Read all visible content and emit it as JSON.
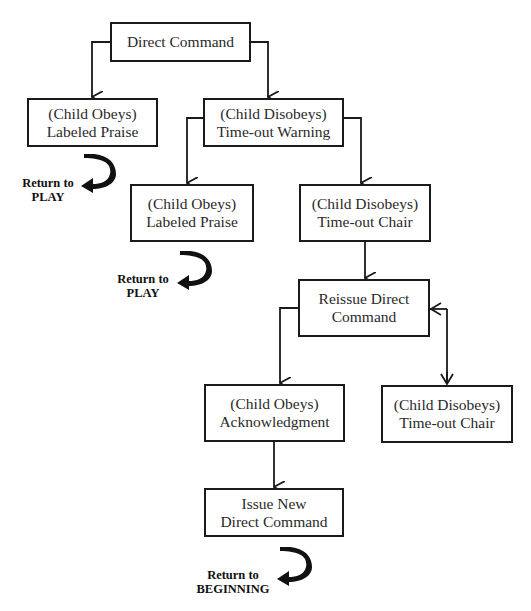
{
  "diagram": {
    "type": "flowchart",
    "line_color": "#1a1a1a",
    "nodes": [
      {
        "id": "direct-command",
        "lines": [
          "Direct Command"
        ]
      },
      {
        "id": "obeys-praise-1",
        "lines": [
          "(Child Obeys)",
          "Labeled Praise"
        ]
      },
      {
        "id": "disobeys-warning",
        "lines": [
          "(Child Disobeys)",
          "Time-out Warning"
        ]
      },
      {
        "id": "obeys-praise-2",
        "lines": [
          "(Child Obeys)",
          "Labeled Praise"
        ]
      },
      {
        "id": "disobeys-chair-1",
        "lines": [
          "(Child Disobeys)",
          "Time-out Chair"
        ]
      },
      {
        "id": "reissue-command",
        "lines": [
          "Reissue Direct",
          "Command"
        ]
      },
      {
        "id": "obeys-acknowledgment",
        "lines": [
          "(Child Obeys)",
          "Acknowledgment"
        ]
      },
      {
        "id": "disobeys-chair-2",
        "lines": [
          "(Child Disobeys)",
          "Time-out Chair"
        ]
      },
      {
        "id": "issue-new-command",
        "lines": [
          "Issue New",
          "Direct Command"
        ]
      }
    ],
    "returns": [
      {
        "id": "return-play-1",
        "lines": [
          "Return to",
          "PLAY"
        ],
        "icon": "curved-return-arrow-icon"
      },
      {
        "id": "return-play-2",
        "lines": [
          "Return to",
          "PLAY"
        ],
        "icon": "curved-return-arrow-icon"
      },
      {
        "id": "return-beginning",
        "lines": [
          "Return to",
          "BEGINNING"
        ],
        "icon": "curved-return-arrow-icon"
      }
    ],
    "edges": [
      {
        "from": "direct-command",
        "to": "obeys-praise-1"
      },
      {
        "from": "direct-command",
        "to": "disobeys-warning"
      },
      {
        "from": "disobeys-warning",
        "to": "obeys-praise-2"
      },
      {
        "from": "disobeys-warning",
        "to": "disobeys-chair-1"
      },
      {
        "from": "disobeys-chair-1",
        "to": "reissue-command"
      },
      {
        "from": "reissue-command",
        "to": "obeys-acknowledgment"
      },
      {
        "from": "reissue-command",
        "to": "disobeys-chair-2",
        "bidirectional": true
      },
      {
        "from": "obeys-acknowledgment",
        "to": "issue-new-command"
      }
    ]
  }
}
